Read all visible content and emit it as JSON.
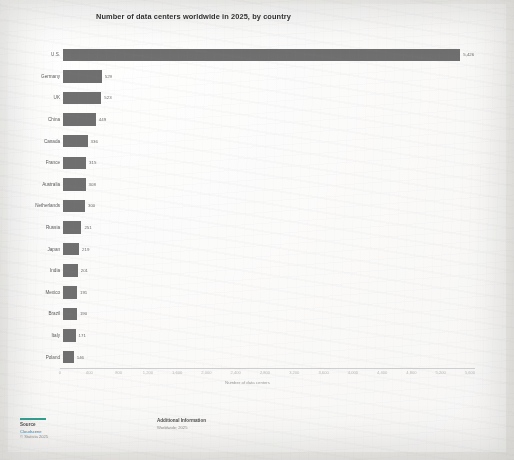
{
  "chart_data": {
    "type": "bar",
    "orientation": "horizontal",
    "title": "Number of data centers worldwide in 2025, by country",
    "xlabel": "Number of data centers",
    "ylabel": "",
    "xlim": [
      0,
      5600
    ],
    "grid": false,
    "legend": "none",
    "categories": [
      "U.S.",
      "Germany",
      "UK",
      "China",
      "Canada",
      "France",
      "Australia",
      "Netherlands",
      "Russia",
      "Japan",
      "India",
      "Mexico",
      "Brazil",
      "Italy",
      "Poland"
    ],
    "values": [
      5426,
      529,
      523,
      449,
      336,
      315,
      308,
      300,
      251,
      219,
      201,
      191,
      190,
      171,
      146
    ],
    "value_labels": [
      "5,426",
      "529",
      "523",
      "449",
      "336",
      "315",
      "308",
      "300",
      "251",
      "219",
      "201",
      "191",
      "190",
      "171",
      "146"
    ],
    "xticks": [
      0,
      400,
      800,
      1200,
      1600,
      2000,
      2400,
      2800,
      3200,
      3600,
      4000,
      4400,
      4800,
      5200,
      5600
    ],
    "xtick_labels": [
      "0",
      "400",
      "800",
      "1,200",
      "1,600",
      "2,000",
      "2,400",
      "2,800",
      "3,200",
      "3,600",
      "4,000",
      "4,400",
      "4,800",
      "5,200",
      "5,600"
    ],
    "bar_color": "#6f6f70",
    "accent_color": "#2f9e8f"
  },
  "footer": {
    "source_heading": "Source",
    "source_lines": [
      "Cloudscene",
      "© Statista 2025"
    ],
    "info_heading": "Additional Information",
    "info_lines": [
      "Worldwide; 2025"
    ]
  }
}
